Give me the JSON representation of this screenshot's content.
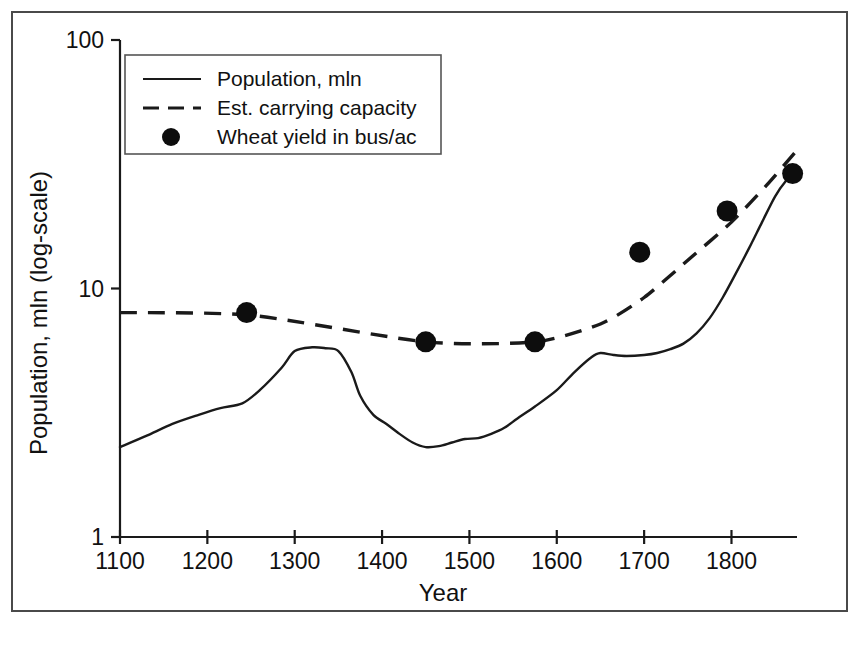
{
  "chart_data": {
    "type": "line",
    "title": "",
    "xlabel": "Year",
    "ylabel": "Population, mln (log-scale)",
    "xlim": [
      1100,
      1875
    ],
    "ylim": [
      1,
      100
    ],
    "yscale": "log",
    "grid": false,
    "legend_position": "top-left-inside",
    "xticks": [
      1100,
      1200,
      1300,
      1400,
      1500,
      1600,
      1700,
      1800
    ],
    "xtick_labels": [
      "1100",
      "1200",
      "1300",
      "1400",
      "1500",
      "1600",
      "1700",
      "1800"
    ],
    "yticks": [
      1,
      10,
      100
    ],
    "ytick_labels": [
      "1",
      "10",
      "100"
    ],
    "series": [
      {
        "name": "Population, mln",
        "style": "solid",
        "x": [
          1100,
          1130,
          1160,
          1190,
          1215,
          1240,
          1260,
          1285,
          1300,
          1320,
          1335,
          1350,
          1365,
          1375,
          1390,
          1405,
          1420,
          1435,
          1450,
          1465,
          1480,
          1495,
          1510,
          1525,
          1540,
          1555,
          1575,
          1600,
          1620,
          1640,
          1650,
          1665,
          1680,
          1700,
          1715,
          1730,
          1745,
          1760,
          1775,
          1790,
          1805,
          1820,
          1835,
          1850,
          1862,
          1875
        ],
        "values": [
          2.3,
          2.55,
          2.85,
          3.1,
          3.3,
          3.45,
          3.9,
          4.8,
          5.6,
          5.8,
          5.75,
          5.6,
          4.6,
          3.7,
          3.1,
          2.85,
          2.6,
          2.4,
          2.3,
          2.32,
          2.4,
          2.48,
          2.5,
          2.6,
          2.75,
          3.0,
          3.35,
          3.9,
          4.6,
          5.3,
          5.5,
          5.4,
          5.35,
          5.4,
          5.5,
          5.7,
          6.0,
          6.6,
          7.6,
          9.2,
          11.5,
          14.5,
          18.5,
          23.5,
          27.0,
          30.0
        ]
      },
      {
        "name": "Est. carrying capacity",
        "style": "dashed",
        "x": [
          1100,
          1250,
          1450,
          1575,
          1650,
          1700,
          1750,
          1800,
          1840,
          1875
        ],
        "values": [
          8.0,
          7.8,
          6.1,
          6.1,
          7.2,
          9.2,
          13.0,
          18.5,
          26.0,
          36.0
        ]
      }
    ],
    "scatter": {
      "name": "Wheat yield in bus/ac",
      "x": [
        1245,
        1450,
        1575,
        1695,
        1795,
        1870
      ],
      "values": [
        8.0,
        6.1,
        6.1,
        14.0,
        20.5,
        29.0
      ]
    },
    "legend": [
      {
        "label": "Population, mln",
        "marker": "solid-line"
      },
      {
        "label": "Est. carrying capacity",
        "marker": "dashed-line"
      },
      {
        "label": "Wheat yield in bus/ac",
        "marker": "filled-circle"
      }
    ],
    "colors": {
      "line": "#1a1a1a",
      "marker": "#0d0d0d",
      "axis": "#1a1a1a",
      "frame": "#4a4a4a",
      "background": "#ffffff"
    }
  }
}
